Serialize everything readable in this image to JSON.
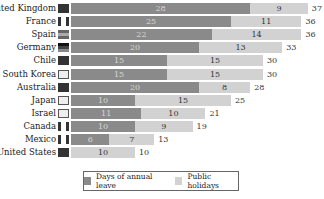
{
  "chart_data": {
    "type": "bar",
    "orientation": "horizontal",
    "stacked": true,
    "title": "",
    "xlabel": "",
    "ylabel": "",
    "categories": [
      "United Kingdom",
      "France",
      "Spain",
      "Germany",
      "Chile",
      "South Korea",
      "Australia",
      "Japan",
      "Israel",
      "Canada",
      "Mexico",
      "United States"
    ],
    "series": [
      {
        "name": "Days of annual leave",
        "color": "#8a8a8a",
        "values": [
          28,
          25,
          22,
          20,
          15,
          15,
          20,
          10,
          11,
          10,
          6,
          0
        ]
      },
      {
        "name": "Public holidays",
        "color": "#d2d2d2",
        "values": [
          9,
          11,
          14,
          13,
          15,
          15,
          8,
          15,
          10,
          9,
          7,
          10
        ]
      }
    ],
    "totals": [
      37,
      36,
      36,
      33,
      30,
      30,
      28,
      25,
      21,
      19,
      13,
      10
    ],
    "legend_position": "bottom",
    "grid": false
  },
  "legend": {
    "leave_label": "Days of annual leave",
    "holiday_label": "Public holidays"
  },
  "flags": [
    "uk-flag",
    "france-flag",
    "spain-flag",
    "germany-flag",
    "chile-flag",
    "south-korea-flag",
    "australia-flag",
    "japan-flag",
    "israel-flag",
    "canada-flag",
    "mexico-flag",
    "usa-flag"
  ]
}
